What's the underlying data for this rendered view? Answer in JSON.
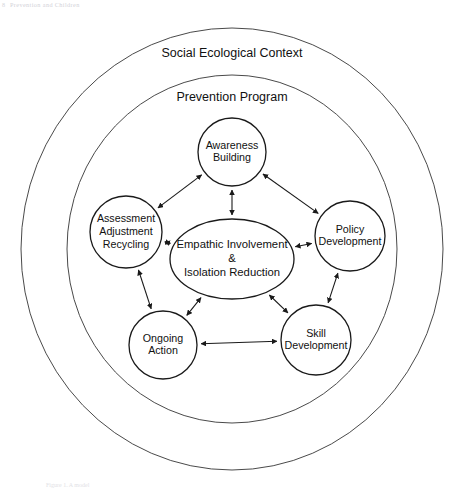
{
  "page": {
    "running_head": "Prevention and Children",
    "page_number": "8",
    "figure_caption": "Figure 1. A model"
  },
  "diagram": {
    "type": "concentric-cycle-diagram",
    "rings": [
      {
        "id": "social-ecological-context",
        "label": "Social Ecological Context",
        "cx": 232,
        "cy": 249,
        "rx": 211,
        "ry": 221,
        "label_x": 232,
        "label_y": 54
      },
      {
        "id": "prevention-program",
        "label": "Prevention Program",
        "cx": 232,
        "cy": 249,
        "rx": 165,
        "ry": 174,
        "label_x": 232,
        "label_y": 98
      }
    ],
    "center_node": {
      "id": "empathic-involvement-isolation-reduction",
      "lines": [
        "Empathic Involvement",
        "&",
        "Isolation Reduction"
      ],
      "cx": 232,
      "cy": 259,
      "rx": 62,
      "ry": 40
    },
    "nodes": [
      {
        "id": "awareness-building",
        "lines": [
          "Awareness",
          "Building"
        ],
        "cx": 232,
        "cy": 152,
        "r": 34
      },
      {
        "id": "policy-development",
        "lines": [
          "Policy",
          "Development"
        ],
        "cx": 350,
        "cy": 236,
        "r": 35
      },
      {
        "id": "skill-development",
        "lines": [
          "Skill",
          "Development"
        ],
        "cx": 316,
        "cy": 340,
        "r": 35
      },
      {
        "id": "ongoing-action",
        "lines": [
          "Ongoing",
          "Action"
        ],
        "cx": 163,
        "cy": 345,
        "r": 34
      },
      {
        "id": "assessment-adjustment-recycling",
        "lines": [
          "Assessment",
          "Adjustment",
          "Recycling"
        ],
        "cx": 126,
        "cy": 232,
        "r": 36
      }
    ],
    "links": [
      {
        "id": "center-awareness-building",
        "from": "empathic-involvement-isolation-reduction",
        "to": "awareness-building",
        "arrows": "both"
      },
      {
        "id": "center-policy-development",
        "from": "empathic-involvement-isolation-reduction",
        "to": "policy-development",
        "arrows": "both"
      },
      {
        "id": "center-skill-development",
        "from": "empathic-involvement-isolation-reduction",
        "to": "skill-development",
        "arrows": "both"
      },
      {
        "id": "center-ongoing-action",
        "from": "empathic-involvement-isolation-reduction",
        "to": "ongoing-action",
        "arrows": "both"
      },
      {
        "id": "center-assessment-adjustment-recycling",
        "from": "empathic-involvement-isolation-reduction",
        "to": "assessment-adjustment-recycling",
        "arrows": "both"
      },
      {
        "id": "awareness-building-policy-development",
        "from": "awareness-building",
        "to": "policy-development",
        "arrows": "both"
      },
      {
        "id": "policy-development-skill-development",
        "from": "policy-development",
        "to": "skill-development",
        "arrows": "both"
      },
      {
        "id": "skill-development-ongoing-action",
        "from": "skill-development",
        "to": "ongoing-action",
        "arrows": "both"
      },
      {
        "id": "ongoing-action-assessment-adjustment-recycling",
        "from": "ongoing-action",
        "to": "assessment-adjustment-recycling",
        "arrows": "both"
      },
      {
        "id": "assessment-adjustment-recycling-awareness-building",
        "from": "assessment-adjustment-recycling",
        "to": "awareness-building",
        "arrows": "both"
      }
    ],
    "colors": {
      "ring_stroke": "#4a4a4a",
      "node_stroke": "#1a1a1a",
      "link_stroke": "#1a1a1a",
      "background": "#ffffff",
      "text": "#111111"
    }
  }
}
